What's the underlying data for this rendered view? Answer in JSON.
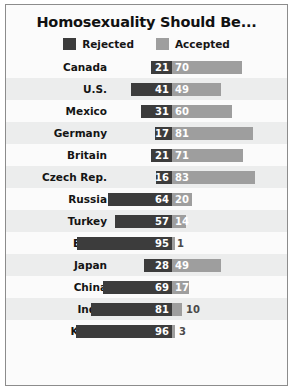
{
  "chart_data": {
    "type": "bar",
    "title": "Homosexuality Should Be...",
    "xlabel": "",
    "ylabel": "",
    "orientation": "horizontal",
    "layout": "diverging-centered",
    "grid": false,
    "legend_position": "top-center",
    "axis_range": [
      0,
      100
    ],
    "units": "percent",
    "colors": {
      "rejected": "#3c3c3c",
      "accepted": "#9e9e9e",
      "row_band": "#eceded",
      "background": "#fbfbfb",
      "border": "#8c8c8c"
    },
    "series": [
      {
        "name": "Rejected",
        "values": [
          21,
          41,
          31,
          17,
          21,
          16,
          64,
          57,
          95,
          28,
          69,
          81,
          96
        ]
      },
      {
        "name": "Accepted",
        "values": [
          70,
          49,
          60,
          81,
          71,
          83,
          20,
          14,
          1,
          49,
          17,
          10,
          3
        ]
      }
    ],
    "categories": [
      "Canada",
      "U.S.",
      "Mexico",
      "Germany",
      "Britain",
      "Czech Rep.",
      "Russia",
      "Turkey",
      "Egypt",
      "Japan",
      "China",
      "India",
      "Kenya"
    ],
    "rows": [
      {
        "country": "Canada",
        "rejected": 21,
        "accepted": 70,
        "accepted_label_outside": false
      },
      {
        "country": "U.S.",
        "rejected": 41,
        "accepted": 49,
        "accepted_label_outside": false
      },
      {
        "country": "Mexico",
        "rejected": 31,
        "accepted": 60,
        "accepted_label_outside": false
      },
      {
        "country": "Germany",
        "rejected": 17,
        "accepted": 81,
        "accepted_label_outside": false
      },
      {
        "country": "Britain",
        "rejected": 21,
        "accepted": 71,
        "accepted_label_outside": false
      },
      {
        "country": "Czech Rep.",
        "rejected": 16,
        "accepted": 83,
        "accepted_label_outside": false
      },
      {
        "country": "Russia",
        "rejected": 64,
        "accepted": 20,
        "accepted_label_outside": false
      },
      {
        "country": "Turkey",
        "rejected": 57,
        "accepted": 14,
        "accepted_label_outside": false
      },
      {
        "country": "Egypt",
        "rejected": 95,
        "accepted": 1,
        "accepted_label_outside": true
      },
      {
        "country": "Japan",
        "rejected": 28,
        "accepted": 49,
        "accepted_label_outside": false
      },
      {
        "country": "China",
        "rejected": 69,
        "accepted": 17,
        "accepted_label_outside": false
      },
      {
        "country": "India",
        "rejected": 81,
        "accepted": 10,
        "accepted_label_outside": true
      },
      {
        "country": "Kenya",
        "rejected": 96,
        "accepted": 3,
        "accepted_label_outside": true
      }
    ]
  },
  "legend": {
    "entries": [
      {
        "label": "Rejected",
        "color": "#3c3c3c"
      },
      {
        "label": "Accepted",
        "color": "#9e9e9e"
      }
    ]
  }
}
